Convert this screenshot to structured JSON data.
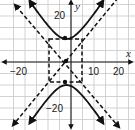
{
  "chart_data": {
    "type": "line",
    "title": "",
    "xlabel": "x",
    "ylabel": "y",
    "xlim": [
      -25,
      25
    ],
    "ylim": [
      -25,
      25
    ],
    "grid": true,
    "grid_step": 5,
    "x_tick_labels": [
      "-20",
      "10",
      "20"
    ],
    "y_tick_labels": [
      "20",
      "-20"
    ],
    "series": [
      {
        "name": "hyperbola upper branch",
        "style": "solid",
        "description": "(y^2/a^2) - ((x-h)^2/b^2) = 1, upper branch",
        "center": [
          -2,
          0
        ],
        "a": 10,
        "b": 6.5
      },
      {
        "name": "hyperbola lower branch",
        "style": "solid",
        "center": [
          -2,
          0
        ],
        "a": 10,
        "b": 6.5
      },
      {
        "name": "asymptotes",
        "style": "dashed"
      },
      {
        "name": "central rectangle",
        "style": "dashed",
        "x": [
          -8.5,
          4.5
        ],
        "y": [
          -10,
          10
        ]
      }
    ],
    "points": [
      {
        "label": "center",
        "x": -2,
        "y": 0
      },
      {
        "label": "upper vertex",
        "x": -2,
        "y": 10
      },
      {
        "label": "lower vertex",
        "x": -2,
        "y": -10
      }
    ]
  },
  "labels": {
    "x_axis": "x",
    "y_axis": "y",
    "x_neg20": "−20",
    "x_10": "10",
    "x_20": "20",
    "y_20": "20",
    "y_neg20": "−20"
  }
}
